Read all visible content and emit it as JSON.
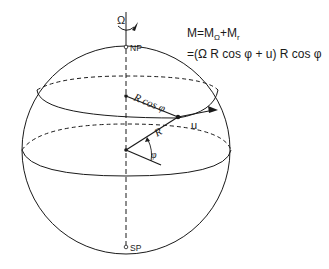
{
  "diagram": {
    "type": "sphere-angular-momentum",
    "labels": {
      "rotation": "Ω",
      "north_pole": "NP",
      "south_pole": "SP",
      "radius_projection": "R cos φ",
      "radius": "R",
      "latitude_angle": "φ",
      "velocity": "u"
    },
    "formula": {
      "line1_lhs": "M=M",
      "line1_sub1": "Ω",
      "line1_mid": "+M",
      "line1_sub2": "r",
      "line2": "=(Ω R  cos φ + u) R cos φ"
    },
    "colors": {
      "ink": "#1a1a1a",
      "background": "#ffffff"
    }
  }
}
